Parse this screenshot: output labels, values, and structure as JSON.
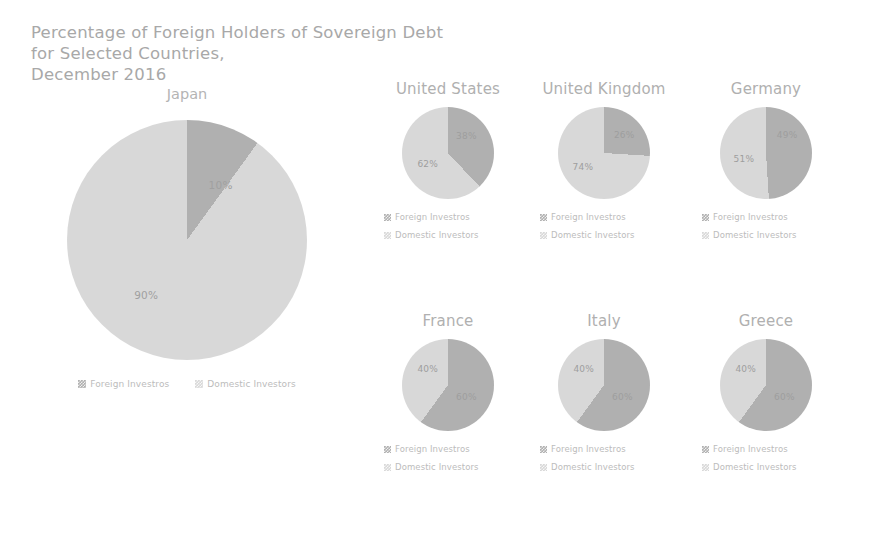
{
  "chart_data": {
    "type": "pie",
    "title": "Percentage of Foreign Holders of Sovereign Debt for Selected Countries, December 2016",
    "title_lines": [
      "Percentage of Foreign Holders of Sovereign Debt",
      "for Selected Countries,",
      "December 2016"
    ],
    "legend_entries": [
      "Foreign Investros",
      "Domestic Investors"
    ],
    "legend_position": "below-each-chart",
    "colors": {
      "foreign": "#b0b0b0",
      "domestic": "#d8d8d8",
      "text": "#aeaeae",
      "background": "#ffffff"
    },
    "series": [
      {
        "name": "Foreign Investros",
        "values": [
          10,
          38,
          26,
          49,
          60,
          60,
          60
        ]
      },
      {
        "name": "Domestic Investors",
        "values": [
          90,
          62,
          74,
          51,
          40,
          40,
          40
        ]
      }
    ],
    "categories": [
      "Japan",
      "United States",
      "United Kingdom",
      "Germany",
      "France",
      "Italy",
      "Greece"
    ],
    "panels": [
      {
        "id": "japan",
        "title": "Japan",
        "size": 240,
        "slices": [
          {
            "label": "10%",
            "value": 10,
            "kind": "foreign",
            "lx": 64,
            "ly": 27
          },
          {
            "label": "90%",
            "value": 90,
            "kind": "domestic",
            "lx": 33,
            "ly": 73
          }
        ]
      },
      {
        "id": "us",
        "title": "United States",
        "size": 92,
        "slices": [
          {
            "label": "38%",
            "value": 38,
            "kind": "foreign",
            "lx": 70,
            "ly": 32
          },
          {
            "label": "62%",
            "value": 62,
            "kind": "domestic",
            "lx": 28,
            "ly": 62
          }
        ]
      },
      {
        "id": "uk",
        "title": "United Kingdom",
        "size": 92,
        "slices": [
          {
            "label": "26%",
            "value": 26,
            "kind": "foreign",
            "lx": 72,
            "ly": 30
          },
          {
            "label": "74%",
            "value": 74,
            "kind": "domestic",
            "lx": 27,
            "ly": 65
          }
        ]
      },
      {
        "id": "de",
        "title": "Germany",
        "size": 92,
        "slices": [
          {
            "label": "49%",
            "value": 49,
            "kind": "foreign",
            "lx": 73,
            "ly": 30
          },
          {
            "label": "51%",
            "value": 51,
            "kind": "domestic",
            "lx": 26,
            "ly": 57
          }
        ]
      },
      {
        "id": "fr",
        "title": "France",
        "size": 92,
        "slices": [
          {
            "label": "60%",
            "value": 60,
            "kind": "foreign",
            "lx": 70,
            "ly": 63
          },
          {
            "label": "40%",
            "value": 40,
            "kind": "domestic",
            "lx": 28,
            "ly": 33
          }
        ]
      },
      {
        "id": "it",
        "title": "Italy",
        "size": 92,
        "slices": [
          {
            "label": "60%",
            "value": 60,
            "kind": "foreign",
            "lx": 70,
            "ly": 63
          },
          {
            "label": "40%",
            "value": 40,
            "kind": "domestic",
            "lx": 28,
            "ly": 33
          }
        ]
      },
      {
        "id": "gr",
        "title": "Greece",
        "size": 92,
        "slices": [
          {
            "label": "60%",
            "value": 60,
            "kind": "foreign",
            "lx": 70,
            "ly": 63
          },
          {
            "label": "40%",
            "value": 40,
            "kind": "domestic",
            "lx": 28,
            "ly": 33
          }
        ]
      }
    ]
  }
}
